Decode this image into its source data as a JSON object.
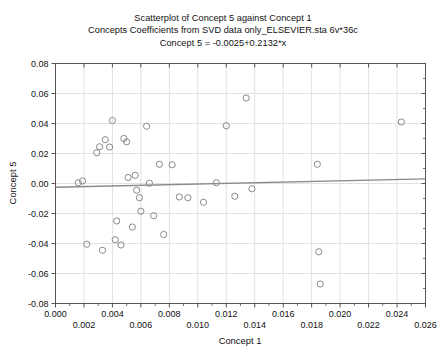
{
  "chart_data": {
    "type": "scatter",
    "title": "Scatterplot of Concept 5 against Concept 1",
    "subtitle": "Concepts Coefficients from SVD data only_ELSEVIER.sta 6v*36c",
    "equation": "Concept 5 = -0.0025+0.2132*x",
    "xlabel": "Concept 1",
    "ylabel": "Concept 5",
    "xlim": [
      0.0,
      0.026
    ],
    "ylim": [
      -0.08,
      0.08
    ],
    "xticks": [
      0.0,
      0.002,
      0.004,
      0.006,
      0.008,
      0.01,
      0.012,
      0.014,
      0.016,
      0.018,
      0.02,
      0.022,
      0.024,
      0.026
    ],
    "xtick_labels": [
      "0.000",
      "0.002",
      "0.004",
      "0.006",
      "0.008",
      "0.010",
      "0.012",
      "0.014",
      "0.016",
      "0.018",
      "0.020",
      "0.022",
      "0.024",
      "0.026"
    ],
    "yticks": [
      -0.08,
      -0.06,
      -0.04,
      -0.02,
      0.0,
      0.02,
      0.04,
      0.06,
      0.08
    ],
    "ytick_labels": [
      "-0.08",
      "-0.06",
      "-0.04",
      "-0.02",
      "0.00",
      "0.02",
      "0.04",
      "0.06",
      "0.08"
    ],
    "grid": true,
    "legend": "none",
    "marker": "open-circle",
    "marker_color": "#8a8a8a",
    "line_color": "#8a8a8a",
    "frame_color": "#555555",
    "fit": {
      "intercept": -0.0025,
      "slope": 0.2132,
      "x_start": 0.0,
      "x_end": 0.026
    },
    "points": [
      {
        "x": 0.0016,
        "y": 0.0005
      },
      {
        "x": 0.0019,
        "y": 0.0017
      },
      {
        "x": 0.0022,
        "y": -0.0405
      },
      {
        "x": 0.0029,
        "y": 0.0205
      },
      {
        "x": 0.0031,
        "y": 0.0245
      },
      {
        "x": 0.0033,
        "y": -0.0445
      },
      {
        "x": 0.0035,
        "y": 0.0292
      },
      {
        "x": 0.0038,
        "y": 0.0243
      },
      {
        "x": 0.004,
        "y": 0.042
      },
      {
        "x": 0.0042,
        "y": -0.0375
      },
      {
        "x": 0.0043,
        "y": -0.025
      },
      {
        "x": 0.0046,
        "y": -0.041
      },
      {
        "x": 0.0048,
        "y": 0.03
      },
      {
        "x": 0.005,
        "y": 0.0278
      },
      {
        "x": 0.0051,
        "y": 0.004
      },
      {
        "x": 0.0054,
        "y": -0.029
      },
      {
        "x": 0.0056,
        "y": 0.0055
      },
      {
        "x": 0.0057,
        "y": -0.0045
      },
      {
        "x": 0.0059,
        "y": -0.0095
      },
      {
        "x": 0.006,
        "y": -0.0185
      },
      {
        "x": 0.0064,
        "y": 0.0382
      },
      {
        "x": 0.0066,
        "y": 0.0002
      },
      {
        "x": 0.0069,
        "y": -0.0215
      },
      {
        "x": 0.0073,
        "y": 0.0128
      },
      {
        "x": 0.0076,
        "y": -0.034
      },
      {
        "x": 0.0082,
        "y": 0.0125
      },
      {
        "x": 0.0087,
        "y": -0.009
      },
      {
        "x": 0.0093,
        "y": -0.0095
      },
      {
        "x": 0.0104,
        "y": -0.0125
      },
      {
        "x": 0.0113,
        "y": 0.0005
      },
      {
        "x": 0.012,
        "y": 0.0385
      },
      {
        "x": 0.0126,
        "y": -0.0085
      },
      {
        "x": 0.0134,
        "y": 0.057
      },
      {
        "x": 0.0138,
        "y": -0.0035
      },
      {
        "x": 0.0184,
        "y": 0.0128
      },
      {
        "x": 0.0185,
        "y": -0.0455
      },
      {
        "x": 0.0186,
        "y": -0.067
      },
      {
        "x": 0.0243,
        "y": 0.041
      }
    ]
  }
}
